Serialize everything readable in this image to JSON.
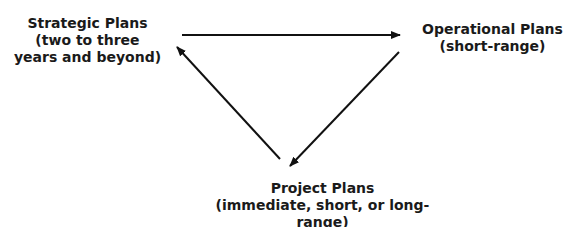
{
  "diagram": {
    "type": "cycle",
    "nodes": [
      {
        "id": "strategic",
        "title": "Strategic Plans",
        "lines": [
          "(two to three",
          "years and beyond)"
        ]
      },
      {
        "id": "operational",
        "title": "Operational Plans",
        "lines": [
          "(short-range)"
        ]
      },
      {
        "id": "project",
        "title": "Project Plans",
        "lines": [
          "(immediate, short, or long-range)"
        ]
      }
    ],
    "edges": [
      {
        "from": "strategic",
        "to": "operational"
      },
      {
        "from": "operational",
        "to": "project"
      },
      {
        "from": "project",
        "to": "strategic"
      }
    ],
    "colors": {
      "text": "#1a1a1a",
      "arrow": "#111111",
      "background": "#ffffff"
    }
  }
}
